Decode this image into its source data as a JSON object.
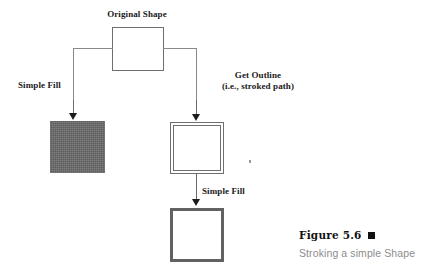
{
  "figure": {
    "title": "Figure 5.6",
    "marker": "black-square-marker",
    "caption": "Stroking a simple Shape"
  },
  "diagram": {
    "type": "flow",
    "top_label": "Original Shape",
    "branch_left_label": "Simple Fill",
    "branch_right_label_line1": "Get Outline",
    "branch_right_label_line2": "(i.e., stroked path)",
    "branch_down_label": "Simple Fill",
    "nodes": [
      {
        "id": "original-shape",
        "kind": "hollow-square",
        "x": 112,
        "y": 27,
        "w": 52,
        "h": 44
      },
      {
        "id": "filled-shape",
        "kind": "gray-filled-square",
        "x": 50,
        "y": 121,
        "w": 55,
        "h": 52
      },
      {
        "id": "outlined-shape",
        "kind": "double-outline-square",
        "x": 170,
        "y": 122,
        "w": 54,
        "h": 52
      },
      {
        "id": "stroked-filled-shape",
        "kind": "thick-border-square",
        "x": 170,
        "y": 208,
        "w": 54,
        "h": 54
      }
    ],
    "colors": {
      "line": "#8a8a8a",
      "arrow": "#1c1c1c",
      "shape_stroke": "#6f6f6f",
      "fill_gray": "#6a6a6a",
      "thick_stroke": "#616161",
      "text": "#1a1a1a",
      "caption_gray": "#8d8d8d",
      "background": "#ffffff"
    }
  }
}
